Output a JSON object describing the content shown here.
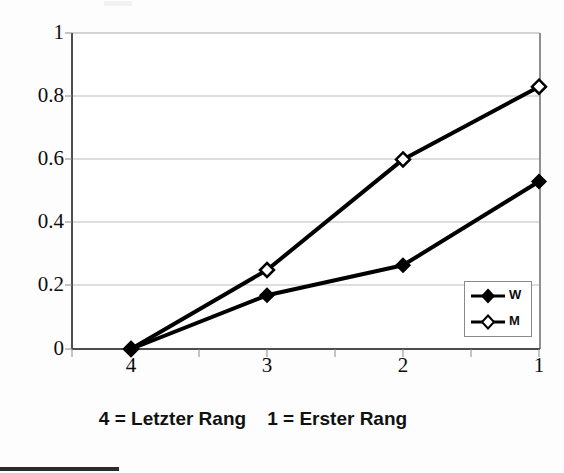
{
  "chart_data": {
    "type": "line",
    "title": "",
    "subtitle": "",
    "xlabel": "",
    "ylabel": "",
    "categories": [
      "4",
      "3",
      "2",
      "1"
    ],
    "series": [
      {
        "name": "W",
        "marker": "filled-diamond",
        "values": [
          0,
          0.17,
          0.265,
          0.53
        ]
      },
      {
        "name": "M",
        "marker": "open-diamond",
        "values": [
          0,
          0.25,
          0.6,
          0.83
        ]
      }
    ],
    "ylim": [
      0,
      1
    ],
    "yticks": [
      0,
      0.2,
      0.4,
      0.6,
      0.8,
      1
    ],
    "ytick_labels": [
      "0",
      "0.2",
      "0.4",
      "0.6",
      "0.8",
      "1"
    ],
    "xtick_labels": [
      "4",
      "3",
      "2",
      "1"
    ],
    "grid": "horizontal",
    "legend_position": "inside-bottom-right",
    "line_color": "#000000",
    "grid_color": "#b8b8b8",
    "axis_color": "#555555"
  },
  "axes": {
    "y_ticks": [
      {
        "label": "1",
        "value": 1.0
      },
      {
        "label": "0.8",
        "value": 0.8
      },
      {
        "label": "0.6",
        "value": 0.6
      },
      {
        "label": "0.4",
        "value": 0.4
      },
      {
        "label": "0.2",
        "value": 0.2
      },
      {
        "label": "0",
        "value": 0.0
      }
    ],
    "x_ticks": [
      {
        "label": "4"
      },
      {
        "label": "3"
      },
      {
        "label": "2"
      },
      {
        "label": "1"
      }
    ]
  },
  "legend": {
    "entries": [
      {
        "label": "W",
        "marker": "filled-diamond"
      },
      {
        "label": "M",
        "marker": "open-diamond"
      }
    ]
  },
  "caption": {
    "text": "4 = Letzter Rang    1 = Erster Rang"
  }
}
